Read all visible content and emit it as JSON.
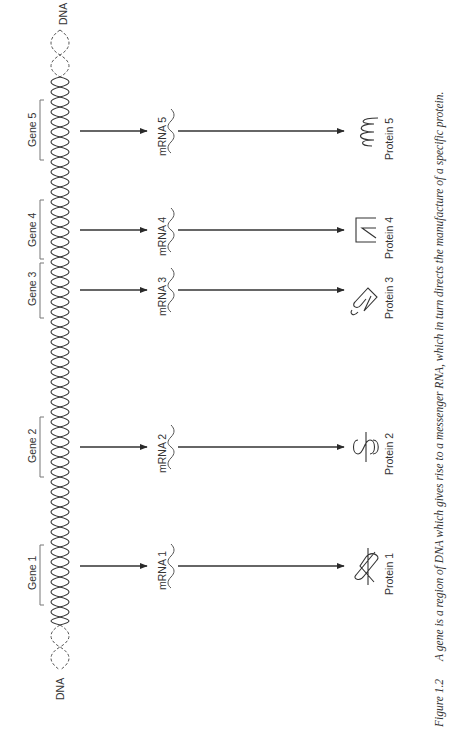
{
  "dna": {
    "label_top": "DNA",
    "label_bottom": "DNA"
  },
  "genes": [
    {
      "label": "Gene 1",
      "mrna": "mRNA 1",
      "protein": "Protein 1",
      "y_start": 545,
      "y_end": 605,
      "arrow_y": 566
    },
    {
      "label": "Gene 2",
      "mrna": "mRNA 2",
      "protein": "Protein 2",
      "y_start": 417,
      "y_end": 477,
      "arrow_y": 447
    },
    {
      "label": "Gene 3",
      "mrna": "mRNA 3",
      "protein": "Protein 3",
      "y_start": 263,
      "y_end": 318,
      "arrow_y": 290
    },
    {
      "label": "Gene 4",
      "mrna": "mRNA 4",
      "protein": "Protein 4",
      "y_start": 200,
      "y_end": 259,
      "arrow_y": 230
    },
    {
      "label": "Gene 5",
      "mrna": "mRNA 5",
      "protein": "Protein 5",
      "y_start": 100,
      "y_end": 160,
      "arrow_y": 131
    }
  ],
  "caption": {
    "number": "Figure 1.2",
    "text": "A gene is a region of DNA which gives rise to a messenger RNA, which in turn directs the manufacture of a specific protein."
  },
  "colors": {
    "ink": "#2a2a2a",
    "background": "#ffffff"
  }
}
